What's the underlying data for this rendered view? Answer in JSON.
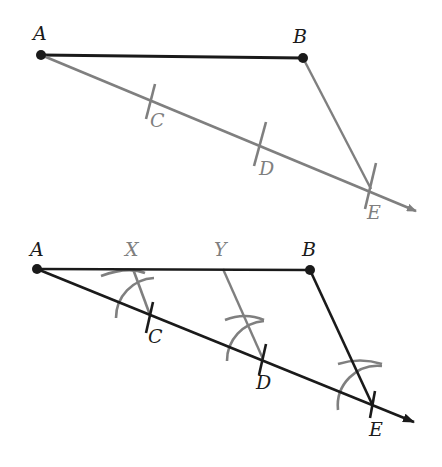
{
  "colors": {
    "black": "#1a1a1a",
    "gray": "#7f7f7f",
    "background": "#ffffff"
  },
  "figure1": {
    "labels": {
      "A": "A",
      "B": "B",
      "C": "C",
      "D": "D",
      "E": "E"
    },
    "points": {
      "A": [
        41,
        55
      ],
      "B": [
        303,
        58
      ],
      "C": [
        152,
        100
      ],
      "D": [
        261,
        145
      ],
      "E": [
        371,
        189
      ]
    },
    "segments": [
      {
        "from": "A",
        "to": "B",
        "color": "black",
        "description": "segment AB"
      },
      {
        "from": "A",
        "to": "ray-end",
        "color": "gray",
        "description": "ray from A through C, D, E"
      },
      {
        "from": "B",
        "to": "E",
        "color": "gray",
        "description": "segment BE"
      }
    ]
  },
  "figure2": {
    "labels": {
      "A": "A",
      "X": "X",
      "Y": "Y",
      "B": "B",
      "C": "C",
      "D": "D",
      "E": "E"
    },
    "points": {
      "A": [
        37,
        269
      ],
      "X": [
        133,
        269
      ],
      "Y": [
        223,
        269
      ],
      "B": [
        310,
        270
      ],
      "C": [
        150,
        315
      ],
      "D": [
        263,
        359
      ],
      "E": [
        372,
        404
      ]
    },
    "segments": [
      {
        "from": "A",
        "to": "B",
        "color": "black",
        "description": "segment AB divided at X and Y"
      },
      {
        "from": "A",
        "to": "ray-end",
        "color": "black",
        "description": "ray from A through C, D, E"
      },
      {
        "from": "B",
        "to": "E",
        "color": "black",
        "description": "segment BE"
      },
      {
        "from": "X",
        "to": "C",
        "color": "gray",
        "description": "parallel XC"
      },
      {
        "from": "Y",
        "to": "D",
        "color": "gray",
        "description": "parallel YD"
      }
    ]
  }
}
